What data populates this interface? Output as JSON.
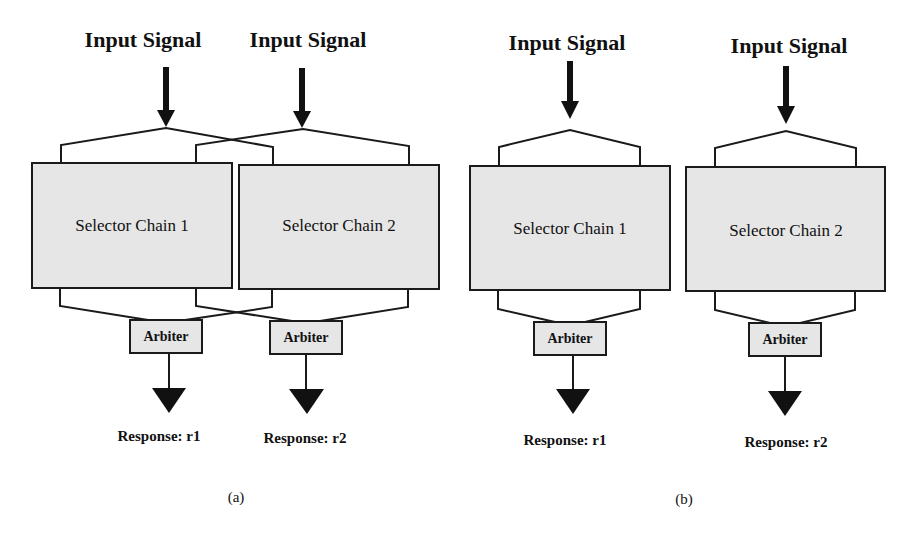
{
  "panels": [
    {
      "caption": "(a)",
      "inputs": [
        "Input Signal",
        "Input Signal"
      ],
      "chains": [
        "Selector Chain 1",
        "Selector Chain 2"
      ],
      "arbiters": [
        "Arbiter",
        "Arbiter"
      ],
      "responses": [
        "Response: r1",
        "Response: r2"
      ],
      "connection": "crossed"
    },
    {
      "caption": "(b)",
      "inputs": [
        "Input Signal",
        "Input Signal"
      ],
      "chains": [
        "Selector Chain 1",
        "Selector Chain 2"
      ],
      "arbiters": [
        "Arbiter",
        "Arbiter"
      ],
      "responses": [
        "Response: r1",
        "Response: r2"
      ],
      "connection": "independent"
    }
  ],
  "colors": {
    "box_fill": "#e6e6e6",
    "stroke": "#1a1a1a",
    "background": "#ffffff"
  }
}
